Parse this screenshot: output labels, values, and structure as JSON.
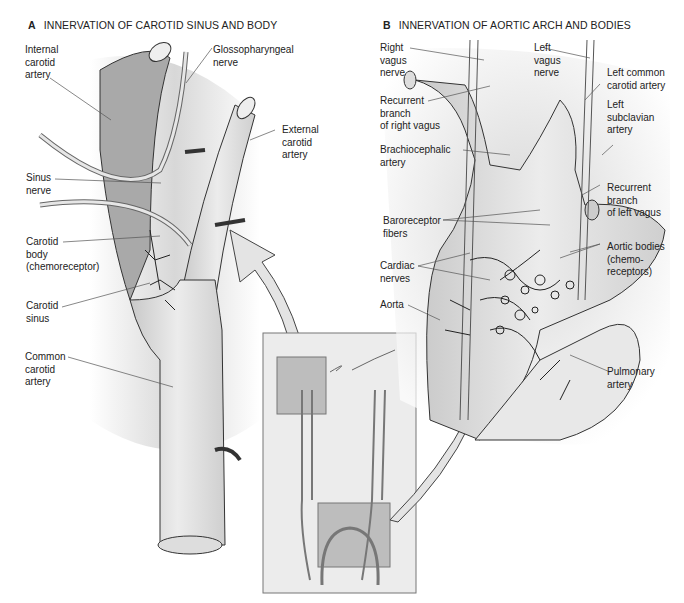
{
  "panel_a": {
    "letter": "A",
    "title": "INNERVATION OF CAROTID SINUS AND BODY",
    "labels": {
      "internal_carotid": "Internal\ncarotid\nartery",
      "glossopharyngeal": "Glossopharyngeal\nnerve",
      "external_carotid": "External\ncarotid\nartery",
      "sinus_nerve": "Sinus\nnerve",
      "carotid_body": "Carotid\nbody\n(chemoreceptor)",
      "carotid_sinus": "Carotid\nsinus",
      "common_carotid": "Common\ncarotid\nartery"
    }
  },
  "panel_b": {
    "letter": "B",
    "title": "INNERVATION OF AORTIC ARCH AND BODIES",
    "labels": {
      "right_vagus": "Right\nvagus\nnerve",
      "left_vagus": "Left\nvagus\nnerve",
      "left_common_carotid": "Left common\ncarotid artery",
      "recurrent_right": "Recurrent\nbranch\nof right vagus",
      "left_subclavian": "Left\nsubclavian\nartery",
      "brachiocephalic": "Brachiocephalic\nartery",
      "recurrent_left": "Recurrent\nbranch\nof left vagus",
      "baroreceptor": "Baroreceptor\nfibers",
      "aortic_bodies": "Aortic bodies\n(chemo-\nreceptors)",
      "cardiac_nerves": "Cardiac\nnerves",
      "aorta": "Aorta",
      "pulmonary": "Pulmonary\nartery"
    }
  },
  "colors": {
    "vessel_fill": "#d9d9d9",
    "vessel_dark": "#a8a8a8",
    "outline": "#333333",
    "inset_bg": "#ececec"
  }
}
